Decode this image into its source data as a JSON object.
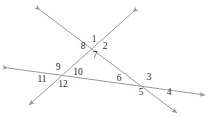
{
  "figure": {
    "type": "geometry-angle-diagram",
    "width": 215,
    "height": 124,
    "background_color": "#ffffff",
    "line_color": "#9a9a9a",
    "label_color": "#2b2b2b",
    "line_width": 1,
    "lines": [
      {
        "name": "line-a",
        "label": "line-upper-left-to-lower-right",
        "x1": 40,
        "y1": 10,
        "x2": 177,
        "y2": 113,
        "arrow_start": true,
        "arrow_end": true
      },
      {
        "name": "line-b",
        "label": "line-upper-right-to-lower-left",
        "x1": 133,
        "y1": 12,
        "x2": 29,
        "y2": 105,
        "arrow_start": true,
        "arrow_end": true
      },
      {
        "name": "line-c",
        "label": "line-left-to-right",
        "x1": 8,
        "y1": 68,
        "x2": 205,
        "y2": 95,
        "arrow_start": true,
        "arrow_end": true
      }
    ],
    "intersections": [
      {
        "name": "intersection-top",
        "x": 96,
        "y": 47,
        "angles": [
          "1",
          "2",
          "7",
          "8"
        ]
      },
      {
        "name": "intersection-left",
        "x": 58,
        "y": 75,
        "angles": [
          "9",
          "10",
          "11",
          "12"
        ]
      },
      {
        "name": "intersection-right",
        "x": 151,
        "y": 84,
        "angles": [
          "3",
          "4",
          "5",
          "6"
        ]
      }
    ],
    "angle_labels": [
      {
        "id": "angle-1",
        "text": "1",
        "x": 94,
        "y": 40
      },
      {
        "id": "angle-2",
        "text": "2",
        "x": 105,
        "y": 47
      },
      {
        "id": "angle-7",
        "text": "7",
        "x": 95,
        "y": 56
      },
      {
        "id": "angle-8",
        "text": "8",
        "x": 83,
        "y": 47
      },
      {
        "id": "angle-9",
        "text": "9",
        "x": 58,
        "y": 68
      },
      {
        "id": "angle-10",
        "text": "10",
        "x": 78,
        "y": 73
      },
      {
        "id": "angle-11",
        "text": "11",
        "x": 42,
        "y": 80
      },
      {
        "id": "angle-12",
        "text": "12",
        "x": 63,
        "y": 85
      },
      {
        "id": "angle-6",
        "text": "6",
        "x": 119,
        "y": 79
      },
      {
        "id": "angle-3",
        "text": "3",
        "x": 149,
        "y": 78
      },
      {
        "id": "angle-5",
        "text": "5",
        "x": 141,
        "y": 93
      },
      {
        "id": "angle-4",
        "text": "4",
        "x": 169,
        "y": 93
      }
    ]
  }
}
